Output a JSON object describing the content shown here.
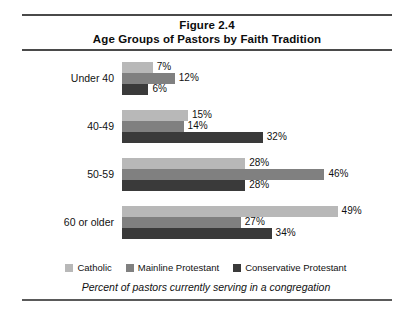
{
  "figure": {
    "title_line1": "Figure 2.4",
    "title_line2": "Age Groups of Pastors by Faith Tradition",
    "footnote": "Percent of pastors currently serving in a congregation"
  },
  "legend": {
    "items": [
      {
        "label": "Catholic",
        "color": "#b8b8b8"
      },
      {
        "label": "Mainline Protestant",
        "color": "#808080"
      },
      {
        "label": "Conservative Protestant",
        "color": "#3a3a3a"
      }
    ]
  },
  "chart_data": {
    "type": "bar",
    "orientation": "horizontal",
    "xlabel": "",
    "ylabel": "",
    "xlim": [
      0,
      50
    ],
    "grid": false,
    "legend_position": "bottom",
    "annotation": "Percent of pastors currently serving in a congregation",
    "categories": [
      "Under 40",
      "40-49",
      "50-59",
      "60 or older"
    ],
    "series": [
      {
        "name": "Catholic",
        "color": "#b8b8b8",
        "values": [
          7,
          15,
          28,
          49
        ],
        "labels": [
          "7%",
          "15%",
          "28%",
          "49%"
        ]
      },
      {
        "name": "Mainline Protestant",
        "color": "#808080",
        "values": [
          12,
          14,
          46,
          27
        ],
        "labels": [
          "12%",
          "14%",
          "46%",
          "27%"
        ]
      },
      {
        "name": "Conservative Protestant",
        "color": "#3a3a3a",
        "values": [
          6,
          32,
          28,
          34
        ],
        "labels": [
          "6%",
          "32%",
          "28%",
          "34%"
        ]
      }
    ]
  }
}
